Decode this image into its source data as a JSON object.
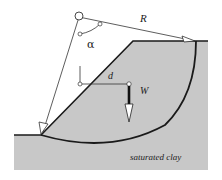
{
  "figure": {
    "type": "slope-stability-diagram",
    "labels": {
      "radius": "R",
      "angle": "α",
      "moment_arm": "d",
      "weight": "W",
      "soil": "saturated clay"
    },
    "colors": {
      "soil_fill": "#c8c8c8",
      "line": "#1a1a1a",
      "background": "#ffffff"
    }
  }
}
